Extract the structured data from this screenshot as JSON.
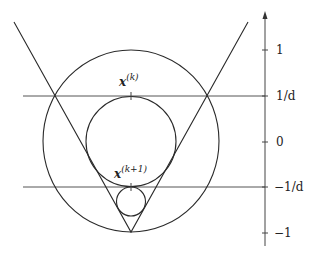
{
  "diagram": {
    "type": "geometric-illustration",
    "axis": {
      "tick_labels": [
        "1",
        "1/d",
        "0",
        "−1/d",
        "−1"
      ]
    },
    "points": {
      "current": {
        "base": "x",
        "sup": "(k)"
      },
      "next": {
        "base": "x",
        "sup": "(k+1)"
      }
    },
    "colors": {
      "stroke": "#2a2a2a",
      "background": "#ffffff"
    }
  }
}
